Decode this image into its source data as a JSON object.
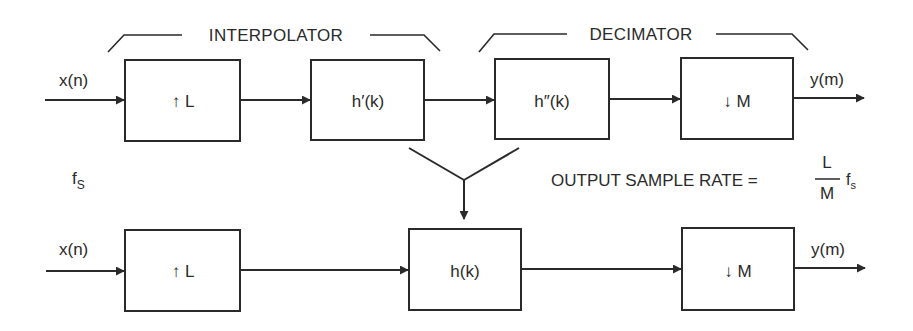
{
  "diagram": {
    "top_row": {
      "input_label": "x(n)",
      "output_label": "y(m)",
      "blocks": [
        {
          "id": "upsample",
          "label": "↑ L"
        },
        {
          "id": "interp_filter",
          "label": "h′(k)"
        },
        {
          "id": "decim_filter",
          "label": "h″(k)"
        },
        {
          "id": "downsample",
          "label": "↓ M"
        }
      ],
      "groups": [
        {
          "id": "interpolator",
          "label": "INTERPOLATOR"
        },
        {
          "id": "decimator",
          "label": "DECIMATOR"
        }
      ]
    },
    "bottom_row": {
      "input_label": "x(n)",
      "output_label": "y(m)",
      "blocks": [
        {
          "id": "upsample",
          "label": "↑ L"
        },
        {
          "id": "combined_filter",
          "label": "h(k)"
        },
        {
          "id": "downsample",
          "label": "↓ M"
        }
      ]
    },
    "input_rate": {
      "f": "f",
      "sub": "S"
    },
    "output_rate": {
      "prefix": "OUTPUT SAMPLE RATE =",
      "numerator": "L",
      "denominator": "M",
      "f": "f",
      "sub": "s"
    }
  },
  "colors": {
    "ink": "#2a2a2a",
    "background": "#ffffff"
  }
}
